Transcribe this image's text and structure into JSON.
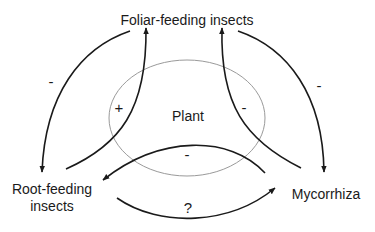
{
  "nodes": {
    "foliar": {
      "label": "Foliar-feeding insects"
    },
    "plant": {
      "label": "Plant"
    },
    "root": {
      "label_line1": "Root-feeding",
      "label_line2": "insects"
    },
    "mycorrhiza": {
      "label": "Mycorrhiza"
    }
  },
  "edges": [
    {
      "from": "Foliar-feeding insects",
      "to": "Root-feeding insects",
      "sign": "-"
    },
    {
      "from": "Root-feeding insects",
      "to": "Foliar-feeding insects",
      "sign": "+"
    },
    {
      "from": "Mycorrhiza",
      "to": "Foliar-feeding insects",
      "sign": "-"
    },
    {
      "from": "Foliar-feeding insects",
      "to": "Mycorrhiza",
      "sign": "-"
    },
    {
      "from": "Mycorrhiza",
      "to": "Root-feeding insects",
      "sign": "-"
    },
    {
      "from": "Root-feeding insects",
      "to": "Mycorrhiza",
      "sign": "?"
    }
  ],
  "colors": {
    "arrow": "#1a1a1a",
    "plant_outline": "#9a9a9a",
    "background": "#ffffff"
  }
}
